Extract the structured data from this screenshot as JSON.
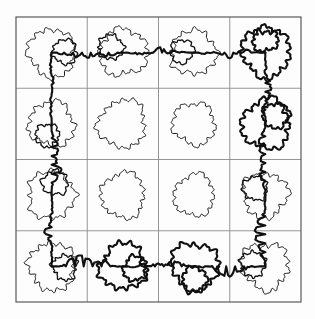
{
  "figure": {
    "title": "Fractal percolation cluster hulls on a 4x4 grid",
    "background_color": "#fdfdfd",
    "grid_line_color": "#8a8a8a",
    "border_color": "#5a5a5a",
    "curve_color": "#101010",
    "thin_stroke_width": 1.0,
    "thick_stroke_width": 2.1,
    "grid_line_width": 0.9,
    "border_line_width": 1.2
  },
  "chart_data": {
    "type": "scatter",
    "title": "Fractal percolation cluster hulls on a 4x4 grid",
    "xlabel": "",
    "ylabel": "",
    "xlim": [
      0,
      4
    ],
    "ylim": [
      0,
      4
    ],
    "grid": true,
    "legend": "none",
    "rows": 4,
    "cols": 4,
    "cell_size_px": 71.25,
    "origin_px": [
      16,
      17
    ],
    "plot_extent_px": [
      16,
      17,
      301,
      305
    ],
    "blob_count": 16,
    "connected_blob_count": 12,
    "isolated_blob_count": 4,
    "isolated_cells": [
      [
        1,
        1
      ],
      [
        1,
        2
      ],
      [
        2,
        1
      ],
      [
        2,
        2
      ]
    ],
    "cells": [
      {
        "row": 0,
        "col": 0,
        "cx": 0.5,
        "cy": 3.5,
        "radius": 0.33,
        "connected": true,
        "thick": false,
        "roughness": 0.14,
        "lobes": 13,
        "seed": 11
      },
      {
        "row": 0,
        "col": 1,
        "cx": 1.5,
        "cy": 3.5,
        "radius": 0.33,
        "connected": true,
        "thick": false,
        "roughness": 0.14,
        "lobes": 14,
        "seed": 23
      },
      {
        "row": 0,
        "col": 2,
        "cx": 2.5,
        "cy": 3.5,
        "radius": 0.31,
        "connected": true,
        "thick": false,
        "roughness": 0.15,
        "lobes": 12,
        "seed": 37
      },
      {
        "row": 0,
        "col": 3,
        "cx": 3.5,
        "cy": 3.5,
        "radius": 0.34,
        "connected": true,
        "thick": true,
        "roughness": 0.14,
        "lobes": 15,
        "seed": 41
      },
      {
        "row": 1,
        "col": 0,
        "cx": 0.5,
        "cy": 2.5,
        "radius": 0.31,
        "connected": true,
        "thick": false,
        "roughness": 0.15,
        "lobes": 13,
        "seed": 53
      },
      {
        "row": 1,
        "col": 1,
        "cx": 1.5,
        "cy": 2.5,
        "radius": 0.33,
        "connected": false,
        "thick": false,
        "roughness": 0.13,
        "lobes": 15,
        "seed": 67
      },
      {
        "row": 1,
        "col": 2,
        "cx": 2.5,
        "cy": 2.5,
        "radius": 0.3,
        "connected": false,
        "thick": false,
        "roughness": 0.13,
        "lobes": 14,
        "seed": 71
      },
      {
        "row": 1,
        "col": 3,
        "cx": 3.5,
        "cy": 2.5,
        "radius": 0.34,
        "connected": true,
        "thick": true,
        "roughness": 0.15,
        "lobes": 14,
        "seed": 83
      },
      {
        "row": 2,
        "col": 0,
        "cx": 0.5,
        "cy": 1.5,
        "radius": 0.33,
        "connected": true,
        "thick": false,
        "roughness": 0.15,
        "lobes": 12,
        "seed": 97
      },
      {
        "row": 2,
        "col": 1,
        "cx": 1.5,
        "cy": 1.5,
        "radius": 0.31,
        "connected": false,
        "thick": false,
        "roughness": 0.13,
        "lobes": 15,
        "seed": 101
      },
      {
        "row": 2,
        "col": 2,
        "cx": 2.5,
        "cy": 1.5,
        "radius": 0.29,
        "connected": false,
        "thick": false,
        "roughness": 0.13,
        "lobes": 14,
        "seed": 113
      },
      {
        "row": 2,
        "col": 3,
        "cx": 3.5,
        "cy": 1.5,
        "radius": 0.32,
        "connected": true,
        "thick": false,
        "roughness": 0.15,
        "lobes": 13,
        "seed": 127
      },
      {
        "row": 3,
        "col": 0,
        "cx": 0.5,
        "cy": 0.5,
        "radius": 0.33,
        "connected": true,
        "thick": false,
        "roughness": 0.15,
        "lobes": 14,
        "seed": 131
      },
      {
        "row": 3,
        "col": 1,
        "cx": 1.5,
        "cy": 0.5,
        "radius": 0.32,
        "connected": true,
        "thick": true,
        "roughness": 0.15,
        "lobes": 14,
        "seed": 149
      },
      {
        "row": 3,
        "col": 2,
        "cx": 2.5,
        "cy": 0.5,
        "radius": 0.33,
        "connected": true,
        "thick": true,
        "roughness": 0.15,
        "lobes": 13,
        "seed": 157
      },
      {
        "row": 3,
        "col": 3,
        "cx": 3.5,
        "cy": 0.5,
        "radius": 0.33,
        "connected": true,
        "thick": false,
        "roughness": 0.15,
        "lobes": 14,
        "seed": 163
      }
    ],
    "backbone_path_cells": [
      [
        0,
        0
      ],
      [
        0,
        1
      ],
      [
        0,
        2
      ],
      [
        0,
        3
      ],
      [
        1,
        3
      ],
      [
        2,
        3
      ],
      [
        3,
        3
      ],
      [
        3,
        2
      ],
      [
        3,
        1
      ],
      [
        3,
        0
      ],
      [
        2,
        0
      ],
      [
        1,
        0
      ]
    ],
    "grid_ticks_x": [
      0,
      1,
      2,
      3,
      4
    ],
    "grid_ticks_y": [
      0,
      1,
      2,
      3,
      4
    ]
  }
}
